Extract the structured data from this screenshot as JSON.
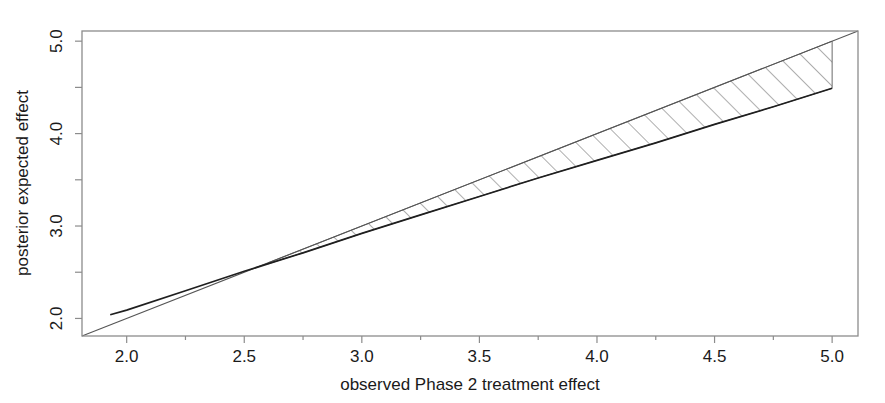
{
  "chart_data": {
    "type": "line",
    "title": "",
    "xlabel": "observed Phase 2 treatment effect",
    "ylabel": "posterior expected effect",
    "xlim": [
      1.81,
      5.11
    ],
    "ylim": [
      1.81,
      5.11
    ],
    "grid": false,
    "legend": null,
    "xticks": [
      2.0,
      2.5,
      3.0,
      3.5,
      4.0,
      4.5,
      5.0
    ],
    "xtick_labels": [
      "2.0",
      "2.5",
      "3.0",
      "3.5",
      "4.0",
      "4.5",
      "5.0"
    ],
    "xminor_ticks": [
      2.25,
      2.75,
      3.25,
      3.75,
      4.25,
      4.75
    ],
    "yticks": [
      2.0,
      3.0,
      4.0,
      5.0
    ],
    "ytick_labels": [
      "2.0",
      "3.0",
      "4.0",
      "5.0"
    ],
    "yminor_ticks": [
      2.5,
      3.5,
      4.5
    ],
    "series": [
      {
        "name": "identity-line",
        "style": "thin-solid",
        "color": "#444444",
        "x": [
          1.81,
          5.11
        ],
        "y": [
          1.81,
          5.11
        ]
      },
      {
        "name": "posterior-expected-curve",
        "style": "thick-solid",
        "color": "#1a1a1a",
        "x": [
          1.93,
          2.0,
          2.25,
          2.5,
          2.6,
          2.75,
          3.0,
          3.25,
          3.5,
          3.75,
          4.0,
          4.25,
          4.5,
          4.75,
          5.0
        ],
        "y": [
          2.04,
          2.09,
          2.3,
          2.51,
          2.59,
          2.71,
          2.92,
          3.12,
          3.32,
          3.52,
          3.71,
          3.9,
          4.1,
          4.29,
          4.49
        ]
      }
    ],
    "shaded_region": {
      "name": "shrinkage-band",
      "fill": "hatch-45",
      "hatch_color": "#555555",
      "upper_series": "identity-line",
      "lower_series": "posterior-expected-curve",
      "x_start": 2.6,
      "x_end": 5.0,
      "closing_edge": "vertical at x = 5.0 from y = 4.49 to y = 5.00"
    }
  },
  "axes": {
    "x_title": "observed Phase 2 treatment effect",
    "y_title": "posterior expected effect",
    "x_tick_labels": [
      "2.0",
      "2.5",
      "3.0",
      "3.5",
      "4.0",
      "4.5",
      "5.0"
    ],
    "y_tick_labels": [
      "2.0",
      "3.0",
      "4.0",
      "5.0"
    ]
  },
  "colors": {
    "background": "#ffffff",
    "frame": "#888888",
    "curve": "#1a1a1a",
    "identity": "#555555",
    "hatch": "#666666",
    "text": "#1a1a1a"
  }
}
